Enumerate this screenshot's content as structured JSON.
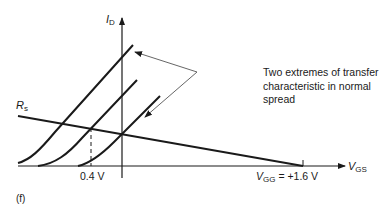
{
  "figure_label": "(f)",
  "axes": {
    "y_axis": {
      "symbol": "I",
      "subscript": "D"
    },
    "x_axis": {
      "symbol": "V",
      "subscript": "GS"
    }
  },
  "load_line": {
    "symbol": "R",
    "subscript": "s"
  },
  "ticks": {
    "threshold_label": "0.4 V",
    "vgg_symbol": "V",
    "vgg_subscript": "GG",
    "vgg_value": " = +1.6 V"
  },
  "annotation": {
    "lines": [
      "Two extremes of transfer",
      "characteristic in normal",
      "spread"
    ]
  },
  "colors": {
    "ink": "#1a1a1a",
    "background": "#ffffff",
    "leader": "#555555"
  }
}
